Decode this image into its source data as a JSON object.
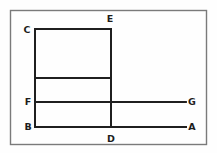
{
  "figure": {
    "type": "geometry-line-diagram",
    "background_color": "#fefefe",
    "stroke_color": "#1f1f1f",
    "label_color": "#1c1c1c",
    "border": {
      "name": "outer-frame",
      "color": "#7a7a7a",
      "x": 10,
      "y": 10,
      "width": 197,
      "height": 135
    },
    "labels": {
      "a": "A",
      "b": "B",
      "c": "C",
      "d": "D",
      "e": "E",
      "f": "F",
      "g": "G"
    },
    "label_positions": {
      "a": {
        "x": 192,
        "y": 127
      },
      "b": {
        "x": 28,
        "y": 127
      },
      "c": {
        "x": 27,
        "y": 30
      },
      "d": {
        "x": 111,
        "y": 139
      },
      "e": {
        "x": 110,
        "y": 19
      },
      "f": {
        "x": 28,
        "y": 102
      },
      "g": {
        "x": 192,
        "y": 102
      }
    },
    "points": {
      "a": {
        "x": 186,
        "y": 127
      },
      "b": {
        "x": 35,
        "y": 127
      },
      "c": {
        "x": 35,
        "y": 29
      },
      "d": {
        "x": 111,
        "y": 127
      },
      "e": {
        "x": 111,
        "y": 29
      },
      "f": {
        "x": 35,
        "y": 102
      },
      "g": {
        "x": 186,
        "y": 102
      }
    },
    "segments": [
      {
        "name": "segment-ce-top",
        "from": "C",
        "to": "E",
        "x1": 35,
        "y1": 29,
        "x2": 111,
        "y2": 29
      },
      {
        "name": "segment-cb-left",
        "from": "C",
        "to": "B",
        "x1": 35,
        "y1": 29,
        "x2": 35,
        "y2": 127
      },
      {
        "name": "segment-ed-right",
        "from": "E",
        "to": "D",
        "x1": 111,
        "y1": 29,
        "x2": 111,
        "y2": 127
      },
      {
        "name": "segment-ba-bottom",
        "from": "B",
        "to": "A",
        "x1": 35,
        "y1": 127,
        "x2": 186,
        "y2": 127
      },
      {
        "name": "segment-fg-middle",
        "from": "F",
        "to": "G",
        "x1": 35,
        "y1": 102,
        "x2": 186,
        "y2": 102
      },
      {
        "name": "segment-unlabeled-crossbar",
        "from": "",
        "to": "",
        "x1": 35,
        "y1": 78,
        "x2": 111,
        "y2": 78
      }
    ]
  }
}
